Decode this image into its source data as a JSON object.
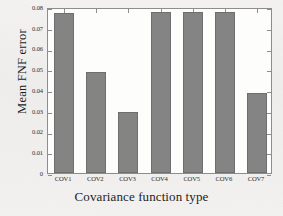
{
  "chart_data": {
    "type": "bar",
    "title": "",
    "xlabel": "Covariance function type",
    "ylabel": "Mean FNF error",
    "categories": [
      "COV1",
      "COV2",
      "COV3",
      "COV4",
      "COV5",
      "COV6",
      "COV7"
    ],
    "values": [
      0.0771,
      0.0487,
      0.0294,
      0.0775,
      0.0775,
      0.0775,
      0.0386
    ],
    "ylim": [
      0,
      0.08
    ],
    "yticks": [
      0,
      0.01,
      0.02,
      0.03,
      0.04,
      0.05,
      0.06,
      0.07,
      0.08
    ],
    "ytick_labels": [
      "0",
      "0.01",
      "0.02",
      "0.03",
      "0.04",
      "0.05",
      "0.06",
      "0.07",
      "0.08"
    ],
    "grid": false,
    "legend": null,
    "bar_color": "#848484",
    "bar_edge_color": "#6e6e6e",
    "axis_color": "#8d8d8d",
    "plot_background": "#fdfdfc",
    "page_background": "#f2f1ef"
  }
}
